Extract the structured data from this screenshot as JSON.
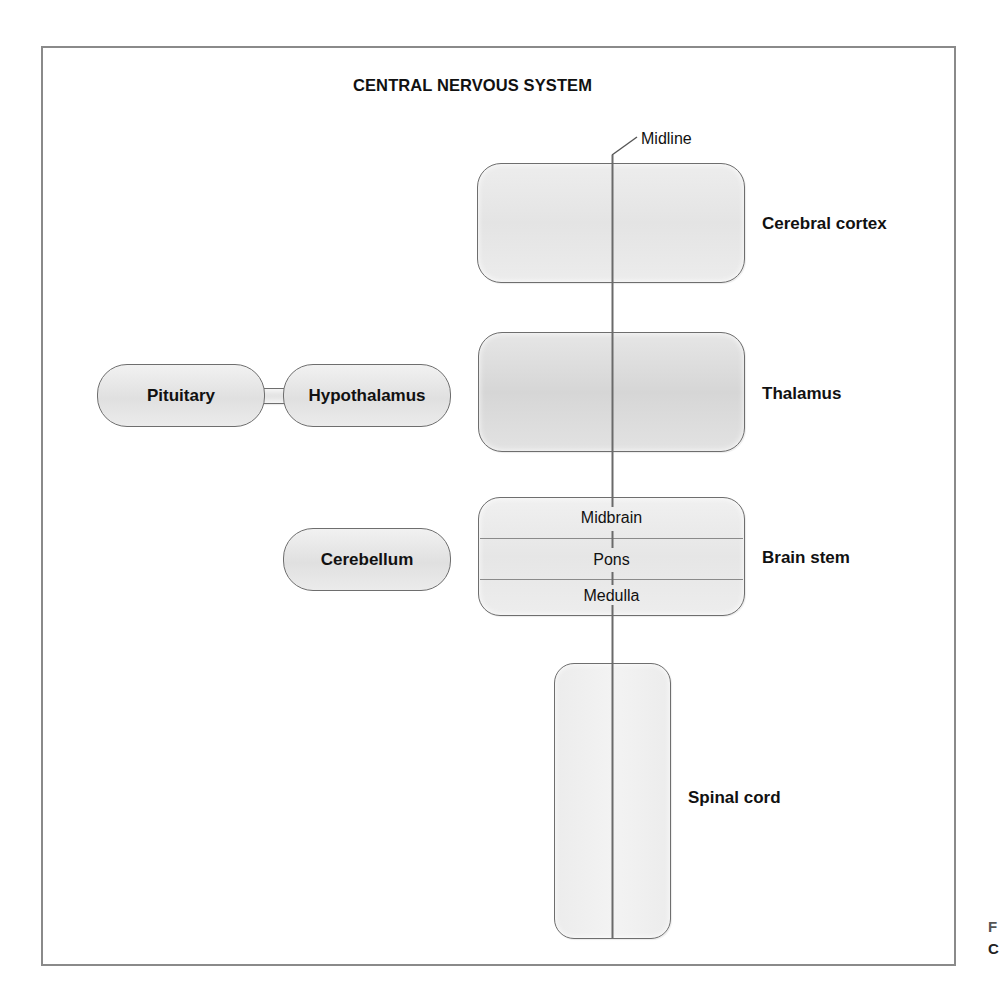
{
  "diagram": {
    "title": "CENTRAL NERVOUS SYSTEM",
    "midline_label": "Midline",
    "structures": {
      "cerebral_cortex": "Cerebral cortex",
      "thalamus": "Thalamus",
      "hypothalamus": "Hypothalamus",
      "pituitary": "Pituitary",
      "cerebellum": "Cerebellum",
      "brain_stem": {
        "label": "Brain stem",
        "parts": [
          "Midbrain",
          "Pons",
          "Medulla"
        ]
      },
      "spinal_cord": "Spinal cord"
    },
    "caption_fragment": [
      "F",
      "C"
    ],
    "colors": {
      "box_fill": "#e6e6e6",
      "box_border": "#6e6e6e",
      "midline": "#6a6a6a",
      "frame": "#8a8a8a"
    }
  }
}
